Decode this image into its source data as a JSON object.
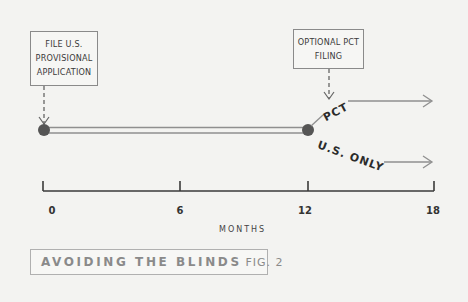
{
  "diagram": {
    "boxes": [
      {
        "id": "provisional",
        "lines": [
          "FILE U.S.",
          "PROVISIONAL",
          "APPLICATION"
        ]
      },
      {
        "id": "pct",
        "lines": [
          "OPTIONAL PCT",
          "FILING"
        ]
      }
    ],
    "branches": {
      "pct_label": "PCT",
      "us_label": "U.S. ONLY"
    },
    "axis": {
      "ticks": [
        "0",
        "6",
        "12",
        "18"
      ],
      "title": "MONTHS"
    },
    "caption": {
      "title": "AVOIDING THE BLINDS",
      "fig": "FIG. 2"
    },
    "colors": {
      "background": "#f3f3f1",
      "line": "#8f8f8f",
      "axis": "#3a3a3a",
      "dot": "#555555",
      "caption_text": "#8a8a8a"
    }
  }
}
